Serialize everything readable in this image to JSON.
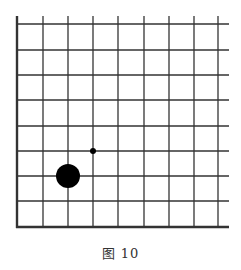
{
  "figure": {
    "caption": "图 10",
    "board": {
      "rows": 9,
      "cols": 9,
      "x_lines": [
        17,
        43,
        68,
        93,
        118,
        144,
        169,
        194,
        218
      ],
      "y_lines": [
        24,
        50,
        75,
        100,
        126,
        151,
        176,
        201,
        227
      ],
      "top_extend": 16,
      "right_extend": 229,
      "line_color": "#333333",
      "edge_left_bold": true,
      "edge_bottom_bold": true
    },
    "stones": [
      {
        "name": "black-stone",
        "col": 2,
        "row": 6,
        "color": "black",
        "radius": 12
      },
      {
        "name": "marker-dot",
        "col": 3,
        "row": 5,
        "color": "black",
        "radius": 3
      }
    ]
  }
}
